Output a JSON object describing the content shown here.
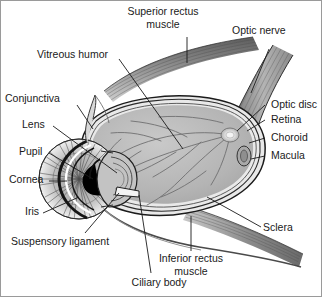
{
  "figure": {
    "background": "#ffffff",
    "border_color": "#9a9a9a",
    "text_color": "#1a1a1a",
    "globe_fill": "#b9b9b9",
    "sclera_fill": "#e8e8e8",
    "muscle_fill": "#9d9d9d",
    "pupil_fill": "#000000"
  },
  "labels": {
    "superior_rectus": "Superior rectus\nmuscle",
    "superior_rectus_line1": "Superior rectus",
    "superior_rectus_line2": "muscle",
    "optic_nerve": "Optic nerve",
    "vitreous_humor": "Vitreous humor",
    "conjunctiva": "Conjunctiva",
    "lens": "Lens",
    "pupil": "Pupil",
    "cornea": "Cornea",
    "iris": "Iris",
    "suspensory_ligament": "Suspensory ligament",
    "ciliary_body": "Ciliary body",
    "optic_disc": "Optic disc",
    "retina": "Retina",
    "choroid": "Choroid",
    "macula": "Macula",
    "sclera": "Sclera",
    "inferior_rectus_line1": "Inferior rectus",
    "inferior_rectus_line2": "muscle"
  }
}
